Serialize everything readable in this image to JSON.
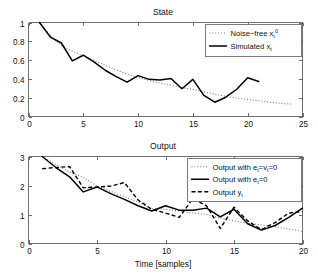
{
  "figure": {
    "background": "#ffffff",
    "width": 318,
    "height": 277
  },
  "chart_data": [
    {
      "id": "state",
      "type": "line",
      "title": "State",
      "xlabel": "",
      "ylabel": "",
      "xlim": [
        0,
        25
      ],
      "ylim": [
        0,
        1
      ],
      "xticks": [
        0,
        5,
        10,
        15,
        20,
        25
      ],
      "xticklabels": [
        "0",
        "5",
        "10",
        "15",
        "20",
        "25"
      ],
      "yticks": [
        0,
        0.2,
        0.4,
        0.6,
        0.8,
        1
      ],
      "yticklabels": [
        "0",
        "0.2",
        "0.4",
        "0.6",
        "0.8",
        "1"
      ],
      "grid": false,
      "legend_position": "upper right",
      "series": [
        {
          "name": "noise-free",
          "label_prefix": "Noise−free x",
          "label_sub": "t",
          "label_sup": "0",
          "style": "dotted",
          "color": "#7a7a7a",
          "x": [
            1,
            2,
            3,
            4,
            5,
            6,
            7,
            8,
            9,
            10,
            11,
            12,
            13,
            14,
            15,
            16,
            17,
            18,
            19,
            20,
            21,
            22,
            23,
            24
          ],
          "y": [
            1.0,
            0.855,
            0.755,
            0.695,
            0.648,
            0.595,
            0.545,
            0.495,
            0.452,
            0.415,
            0.385,
            0.355,
            0.332,
            0.308,
            0.288,
            0.262,
            0.238,
            0.215,
            0.196,
            0.18,
            0.168,
            0.152,
            0.14,
            0.132
          ]
        },
        {
          "name": "simulated",
          "label_prefix": "Simulated x",
          "label_sub": "t",
          "label_sup": "",
          "style": "solid",
          "color": "#000000",
          "x": [
            1,
            2,
            3,
            4,
            5,
            6,
            7,
            8,
            9,
            10,
            11,
            12,
            13,
            14,
            15,
            16,
            17,
            18,
            19,
            20,
            21
          ],
          "y": [
            1.0,
            0.845,
            0.782,
            0.592,
            0.652,
            0.578,
            0.492,
            0.425,
            0.365,
            0.435,
            0.395,
            0.388,
            0.405,
            0.295,
            0.395,
            0.225,
            0.152,
            0.205,
            0.29,
            0.412,
            0.372
          ]
        }
      ]
    },
    {
      "id": "output",
      "type": "line",
      "title": "Output",
      "xlabel": "Time [samples]",
      "ylabel": "",
      "xlim": [
        0,
        20
      ],
      "ylim": [
        0,
        3
      ],
      "xticks": [
        0,
        5,
        10,
        15,
        20
      ],
      "xticklabels": [
        "0",
        "5",
        "10",
        "15",
        "20"
      ],
      "yticks": [
        0,
        1,
        2,
        3
      ],
      "yticklabels": [
        "0",
        "1",
        "2",
        "3"
      ],
      "grid": false,
      "legend_position": "upper right",
      "series": [
        {
          "name": "output-ev-zero",
          "label_prefix": "Output with e",
          "label_sub": "t",
          "label_mid": "=v",
          "label_sub2": "t",
          "label_suffix": "=0",
          "style": "dotted",
          "color": "#7a7a7a",
          "x": [
            1,
            2,
            3,
            4,
            5,
            6,
            7,
            8,
            9,
            10,
            11,
            12,
            13,
            14,
            15,
            16,
            17,
            18,
            19,
            20
          ],
          "y": [
            3.0,
            2.72,
            2.46,
            2.28,
            1.98,
            1.8,
            1.62,
            1.42,
            1.2,
            1.18,
            1.12,
            1.05,
            1.0,
            0.88,
            0.78,
            0.7,
            0.64,
            0.58,
            0.5,
            0.42
          ]
        },
        {
          "name": "output-e-zero",
          "label_prefix": "Output with e",
          "label_sub": "t",
          "label_suffix": "=0",
          "style": "solid",
          "color": "#000000",
          "x": [
            1,
            2,
            3,
            4,
            5,
            6,
            7,
            8,
            9,
            10,
            11,
            12,
            13,
            14,
            15,
            16,
            17,
            18,
            19,
            20
          ],
          "y": [
            3.0,
            2.62,
            2.3,
            1.78,
            1.95,
            1.72,
            1.52,
            1.3,
            1.12,
            1.3,
            1.15,
            1.15,
            1.22,
            0.92,
            1.18,
            0.68,
            0.46,
            0.62,
            0.9,
            1.22
          ]
        },
        {
          "name": "output-y",
          "label_prefix": "Output y",
          "label_sub": "t",
          "label_suffix": "",
          "style": "dashed",
          "color": "#000000",
          "x": [
            1,
            2,
            3,
            4,
            5,
            6,
            7,
            8,
            9,
            10,
            11,
            12,
            13,
            14,
            15,
            16,
            17,
            18,
            19,
            20
          ],
          "y": [
            2.58,
            2.62,
            2.65,
            1.92,
            1.95,
            1.98,
            2.1,
            1.5,
            1.18,
            1.05,
            0.9,
            1.55,
            1.3,
            0.52,
            1.25,
            0.78,
            0.48,
            0.72,
            1.05,
            1.1
          ]
        }
      ]
    }
  ],
  "legends": {
    "state": [
      {
        "style": "dotted",
        "text": "Noise−free x",
        "sub": "t",
        "sup": "0"
      },
      {
        "style": "solid",
        "text": "Simulated x",
        "sub": "t",
        "sup": ""
      }
    ],
    "output": [
      {
        "style": "dotted",
        "text": "Output with e",
        "sub": "t",
        "mid": "=v",
        "sub2": "t",
        "tail": "=0"
      },
      {
        "style": "solid",
        "text": "Output with e",
        "sub": "t",
        "mid": "",
        "sub2": "",
        "tail": "=0"
      },
      {
        "style": "dashed",
        "text": "Output y",
        "sub": "t",
        "mid": "",
        "sub2": "",
        "tail": ""
      }
    ]
  },
  "colors": {
    "axis": "#4d4d4d",
    "solid_series": "#000000",
    "dotted_series": "#7a7a7a",
    "text": "#111111",
    "background": "#ffffff"
  }
}
